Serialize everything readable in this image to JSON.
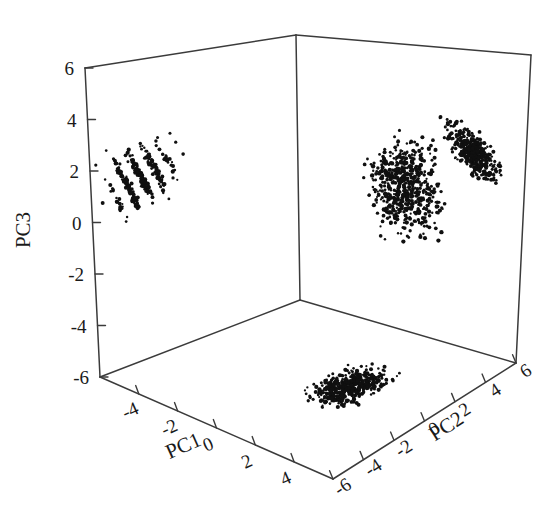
{
  "figure": {
    "kind": "3d-scatter",
    "background_color": "#ffffff",
    "point_color": "#101010",
    "axis_color": "#3b3b3b",
    "width": 558,
    "height": 519
  },
  "axes": {
    "pc1": {
      "label": "PC1",
      "ticks": [
        "-4",
        "-2",
        "0",
        "2",
        "4"
      ],
      "tick_values": [
        -4,
        -2,
        0,
        2,
        4
      ],
      "range": [
        -6,
        6
      ]
    },
    "pc2": {
      "label": "PC2",
      "ticks": [
        "-6",
        "-4",
        "-2",
        "0",
        "2",
        "4",
        "6"
      ],
      "tick_values": [
        -6,
        -4,
        -2,
        0,
        2,
        4,
        6
      ],
      "range": [
        -6,
        6
      ]
    },
    "pc3": {
      "label": "PC3",
      "ticks": [
        "6",
        "4",
        "2",
        "0",
        "-2",
        "-4",
        "-6"
      ],
      "tick_values": [
        6,
        4,
        2,
        0,
        -2,
        -4,
        -6
      ],
      "range": [
        -6,
        6
      ]
    }
  },
  "chart_data": {
    "type": "scatter",
    "title": "",
    "xlabel": "PC1",
    "ylabel": "PC2",
    "zlabel": "PC3",
    "xlim": [
      -6,
      6
    ],
    "ylim": [
      -6,
      6
    ],
    "zlim": [
      -6,
      6
    ],
    "grid": false,
    "legend": "none",
    "projection": "3d-box-wireframe",
    "n_points": 1600,
    "clusters": [
      {
        "name": "left-wall-projection-streaks",
        "panel": "back-left-wall",
        "n": 330,
        "center": [
          -3.1,
          1.3
        ],
        "spread": [
          1.5,
          1.0
        ],
        "streak_angle_deg": -58,
        "streak_count": 7,
        "note": "striated diagonal bands of points projected onto the PC1/PC3 back wall"
      },
      {
        "name": "central-core",
        "panel": "back-right-wall",
        "n": 620,
        "center": [
          -0.3,
          0.0
        ],
        "spread": [
          1.5,
          1.6
        ],
        "note": "dense round core straddling the vertical back edge"
      },
      {
        "name": "upper-right-cloud",
        "panel": "back-right-wall",
        "n": 420,
        "center": [
          3.2,
          1.9
        ],
        "spread": [
          1.2,
          1.0
        ],
        "streak_angle_deg": -35,
        "note": "elongated dense blob in the upper right of the right wall"
      },
      {
        "name": "floor-projection",
        "panel": "floor",
        "n": 500,
        "center": [
          0.4,
          -1.6
        ],
        "spread": [
          1.6,
          0.9
        ],
        "note": "flattened oval of points projected on the bottom floor panel"
      }
    ]
  }
}
